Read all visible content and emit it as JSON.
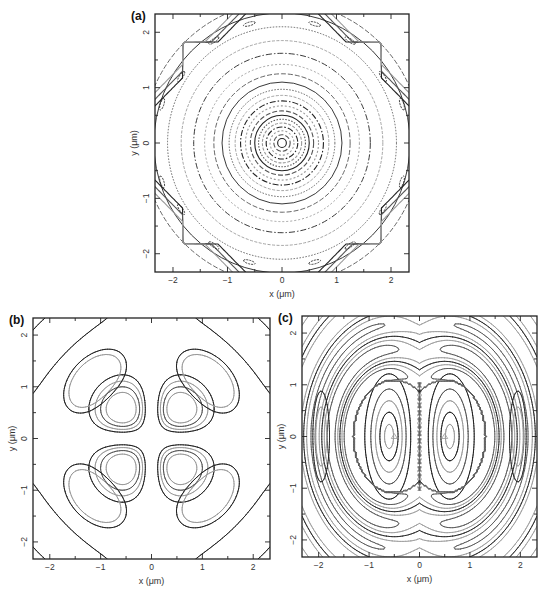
{
  "figure": {
    "panels": [
      "a",
      "b",
      "c"
    ]
  },
  "chart_data": [
    {
      "id": "a",
      "type": "contour",
      "label": "(a)",
      "title": "",
      "xlabel": "x (μm)",
      "ylabel": "y (μm)",
      "xlim": [
        -2.33,
        2.33
      ],
      "ylim": [
        -2.33,
        2.33
      ],
      "xticks": [
        -2,
        -1,
        0,
        1,
        2
      ],
      "yticks": [
        -2,
        -1,
        0,
        1,
        2
      ],
      "xtick_labels": [
        "−2",
        "−1",
        "0",
        "1",
        "2"
      ],
      "ytick_labels": [
        "−2",
        "−1",
        "0",
        "1",
        "2"
      ],
      "minor_ticks": 0.5,
      "grid": false,
      "description": "Concentric circular contours centered at origin (radially symmetric field); dense rings near center, widening outward; corner diagonal contour bands at |x|,|y|≈2.2",
      "contour_radii": [
        0.08,
        0.15,
        0.22,
        0.29,
        0.36,
        0.43,
        0.5,
        0.58,
        0.67,
        0.76,
        0.86,
        0.97,
        1.1,
        1.25,
        1.42,
        1.62,
        1.85,
        2.1,
        2.35,
        2.55
      ],
      "corner_bands": [
        3.0,
        3.12,
        3.24
      ]
    },
    {
      "id": "b",
      "type": "contour",
      "label": "(b)",
      "title": "",
      "xlabel": "x (μm)",
      "ylabel": "y (μm)",
      "xlim": [
        -2.33,
        2.33
      ],
      "ylim": [
        -2.33,
        2.33
      ],
      "xticks": [
        -2,
        -1,
        0,
        1,
        2
      ],
      "yticks": [
        -2,
        -1,
        0,
        1,
        2
      ],
      "xtick_labels": [
        "−2",
        "−1",
        "0",
        "1",
        "2"
      ],
      "ytick_labels": [
        "−2",
        "−1",
        "0",
        "1",
        "2"
      ],
      "minor_ticks": 0.5,
      "grid": false,
      "description": "Four-lobed (quadrupole-like) pattern: inner lobes centered at (±0.55, ±0.55), outer crescent lobes along diagonals at r≈1.6, outer diagonal bands at corners",
      "inner_lobe_centers": [
        [
          -0.55,
          0.55
        ],
        [
          0.55,
          0.55
        ],
        [
          -0.55,
          -0.55
        ],
        [
          0.55,
          -0.55
        ]
      ],
      "inner_lobe_levels": [
        0.3,
        0.42,
        0.54,
        0.66
      ],
      "outer_lobe_levels": [
        0.55,
        0.8
      ],
      "outer_lobe_radius": 1.6
    },
    {
      "id": "c",
      "type": "contour",
      "label": "(c)",
      "title": "",
      "xlabel": "x (μm)",
      "ylabel": "y (μm)",
      "xlim": [
        -2.33,
        2.33
      ],
      "ylim": [
        -2.33,
        2.33
      ],
      "xticks": [
        -2,
        -1,
        0,
        1,
        2
      ],
      "yticks": [
        -2,
        -1,
        0,
        1,
        2
      ],
      "xtick_labels": [
        "−2",
        "−1",
        "0",
        "1",
        "2"
      ],
      "ytick_labels": [
        "−2",
        "−1",
        "0",
        "1",
        "2"
      ],
      "minor_ticks": 0.5,
      "grid": false,
      "description": "Two-lobed (dipole-like) pattern: elongated elliptical lobes centered at (±0.5, 0) with small triangle markers at centers, steep gradient along x=0, surrounding curved S-shaped bands",
      "lobe_centers": [
        [
          -0.5,
          0
        ],
        [
          0.5,
          0
        ]
      ],
      "markers": [
        {
          "x": -0.5,
          "y": 0,
          "symbol": "triangle"
        },
        {
          "x": 0.5,
          "y": 0,
          "symbol": "triangle"
        }
      ]
    }
  ],
  "layout": {
    "panels": {
      "a": {
        "left": 155,
        "top": 14,
        "right": 409,
        "bottom": 272
      },
      "b": {
        "left": 33,
        "top": 318,
        "right": 270,
        "bottom": 559
      },
      "c": {
        "left": 302,
        "top": 316,
        "right": 537,
        "bottom": 557
      }
    },
    "colors": {
      "dark": "#222222",
      "mid": "#555555",
      "light": "#9a9a9a",
      "frame": "#222222"
    }
  }
}
